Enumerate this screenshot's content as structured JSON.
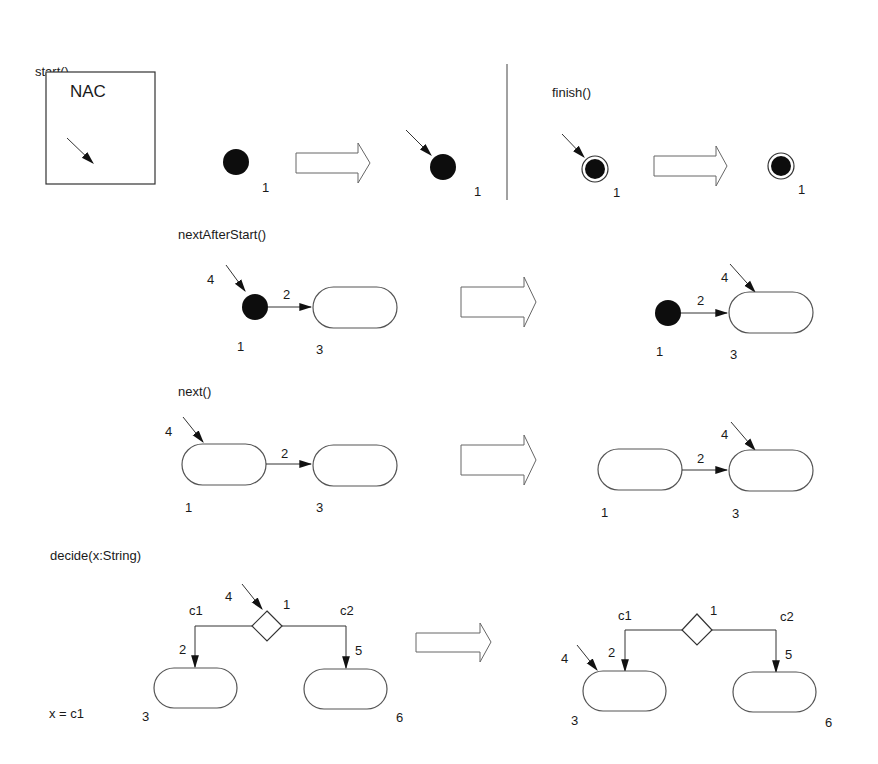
{
  "diagram": {
    "colors": {
      "ink": "#1a1a1a",
      "node_stroke": "#555555",
      "dot_fill": "#0d0d0d",
      "background": "#ffffff"
    },
    "rules": {
      "start": {
        "title": "start()",
        "nac_label": "NAC",
        "lhs_node_id": "1",
        "rhs_node_id": "1"
      },
      "finish": {
        "title": "finish()",
        "lhs_node_id": "1",
        "rhs_node_id": "1"
      },
      "nextAfterStart": {
        "title": "nextAfterStart()",
        "lhs": {
          "pointer_id": "4",
          "edge_id": "2",
          "initial_id": "1",
          "action_id": "3"
        },
        "rhs": {
          "pointer_id": "4",
          "edge_id": "2",
          "initial_id": "1",
          "action_id": "3"
        }
      },
      "next": {
        "title": "next()",
        "lhs": {
          "pointer_id": "4",
          "edge_id": "2",
          "source_id": "1",
          "target_id": "3"
        },
        "rhs": {
          "pointer_id": "4",
          "edge_id": "2",
          "source_id": "1",
          "target_id": "3"
        }
      },
      "decide": {
        "title": "decide(x:String)",
        "condition": "x = c1",
        "lhs": {
          "pointer_id": "4",
          "decision_id": "1",
          "guard_left": "c1",
          "guard_right": "c2",
          "edge_left_id": "2",
          "edge_right_id": "5",
          "left_action_id": "3",
          "right_action_id": "6"
        },
        "rhs": {
          "pointer_id": "4",
          "decision_id": "1",
          "guard_left": "c1",
          "guard_right": "c2",
          "edge_left_id": "2",
          "edge_right_id": "5",
          "left_action_id": "3",
          "right_action_id": "6"
        }
      }
    }
  }
}
